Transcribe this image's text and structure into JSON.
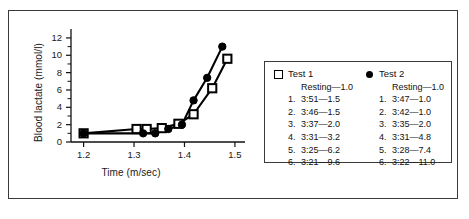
{
  "chart_data": {
    "type": "line",
    "title": "",
    "xlabel": "Time (m/sec)",
    "ylabel": "Blood lactate (mmol/l)",
    "xlim": [
      1.175,
      1.52
    ],
    "ylim": [
      0,
      12.8
    ],
    "xticks": [
      "1.2",
      "1.3",
      "1.4",
      "1.5"
    ],
    "xtick_values": [
      1.2,
      1.3,
      1.4,
      1.5
    ],
    "yticks": [
      "0",
      "2",
      "4",
      "6",
      "8",
      "10",
      "12"
    ],
    "ytick_values": [
      0,
      2,
      4,
      6,
      8,
      10,
      12
    ],
    "grid": false,
    "legend_position": "right",
    "series": [
      {
        "name": "Test 1",
        "marker": "open-square",
        "color": "#000000",
        "x": [
          1.2,
          1.305,
          1.325,
          1.355,
          1.388,
          1.418,
          1.455,
          1.485
        ],
        "y": [
          1.0,
          1.5,
          1.5,
          1.6,
          2.1,
          3.2,
          6.2,
          9.6
        ],
        "labels": [
          "Resting",
          "1.",
          "2.",
          "3.",
          "4.",
          "5.",
          "6."
        ]
      },
      {
        "name": "Test 2",
        "marker": "filled-circle",
        "color": "#000000",
        "x": [
          1.2,
          1.318,
          1.342,
          1.368,
          1.395,
          1.418,
          1.445,
          1.475
        ],
        "y": [
          1.0,
          1.0,
          1.0,
          1.5,
          2.0,
          4.8,
          7.4,
          11.0
        ],
        "labels": [
          "Resting",
          "1.",
          "2.",
          "3.",
          "4.",
          "5.",
          "6."
        ]
      }
    ]
  },
  "legend": {
    "columns": [
      {
        "title": "Test 1",
        "marker_name": "open-square-marker",
        "rows": [
          {
            "index": "",
            "text": "Resting—1.0"
          },
          {
            "index": "1.",
            "text": "3:51—1.5"
          },
          {
            "index": "2.",
            "text": "3:46—1.5"
          },
          {
            "index": "3.",
            "text": "3:37—2.0"
          },
          {
            "index": "4.",
            "text": "3:31—3.2"
          },
          {
            "index": "5.",
            "text": "3:25—6.2"
          },
          {
            "index": "6.",
            "text": "3:21—9.6"
          }
        ]
      },
      {
        "title": "Test 2",
        "marker_name": "filled-circle-marker",
        "rows": [
          {
            "index": "",
            "text": "Resting—1.0"
          },
          {
            "index": "1.",
            "text": "3:47—1.0"
          },
          {
            "index": "2.",
            "text": "3:42—1.0"
          },
          {
            "index": "3.",
            "text": "3:35—2.0"
          },
          {
            "index": "4.",
            "text": "3:31—4.8"
          },
          {
            "index": "5.",
            "text": "3:28—7.4"
          },
          {
            "index": "6.",
            "text": "3:22—11.0"
          }
        ]
      }
    ]
  },
  "axes": {
    "x_title": "Time (m/sec)",
    "y_title": "Blood lactate (mmol/l)"
  },
  "colors": {
    "ink": "#000000",
    "frame": "#3a3a3a",
    "background": "#ffffff"
  }
}
